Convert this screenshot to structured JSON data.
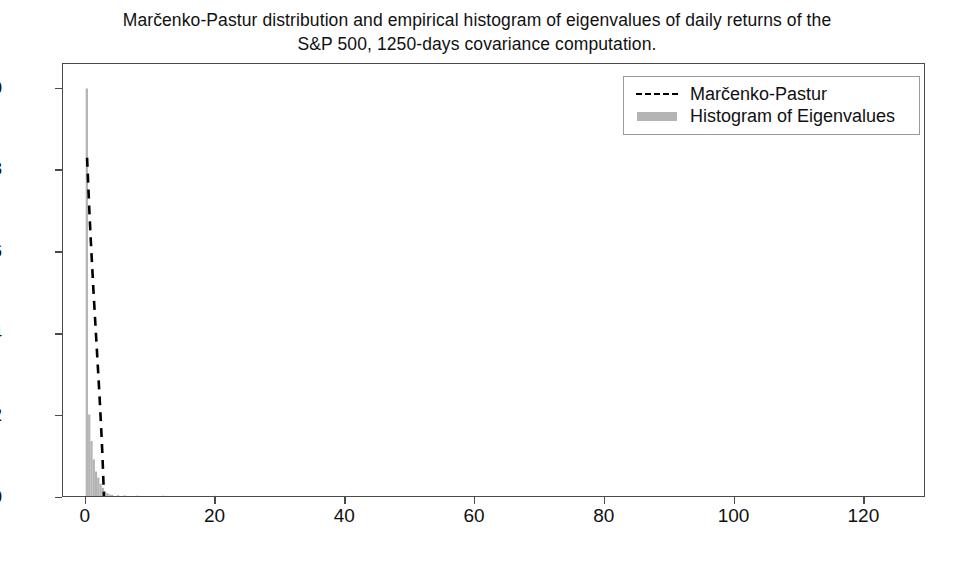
{
  "chart_data": {
    "type": "bar",
    "title": "Marčenko-Pastur distribution and empirical histogram of eigenvalues of daily returns of the\nS&P 500, 1250-days covariance computation.",
    "xlabel": "",
    "ylabel": "",
    "xlim": [
      -3.5,
      129.5
    ],
    "ylim": [
      0.0,
      1.06
    ],
    "grid": false,
    "legend_position": "upper right",
    "xticks": [
      0,
      20,
      40,
      60,
      80,
      100,
      120
    ],
    "xtick_labels": [
      "0",
      "20",
      "40",
      "60",
      "80",
      "100",
      "120"
    ],
    "yticks": [
      0.0,
      0.2,
      0.4,
      0.6,
      0.8,
      1.0
    ],
    "ytick_labels": [
      "0.0",
      "0.2",
      "0.4",
      "0.6",
      "0.8",
      "1.0"
    ],
    "series": [
      {
        "name": "Histogram of Eigenvalues",
        "type": "bar",
        "color": "#b4b4b4",
        "bar_width": 0.35,
        "x": [
          0.18,
          0.55,
          0.9,
          1.25,
          1.6,
          1.95,
          2.3,
          2.65,
          3.0,
          3.35,
          3.7,
          4.1,
          5.0,
          6.0,
          8.0,
          12.0,
          20.0,
          40.0,
          80.0,
          120.0
        ],
        "values": [
          1.0,
          0.2,
          0.135,
          0.09,
          0.06,
          0.045,
          0.03,
          0.02,
          0.012,
          0.007,
          0.004,
          0.003,
          0.002,
          0.0015,
          0.001,
          0.0008,
          0.0005,
          0.0003,
          0.0002,
          0.0001
        ]
      },
      {
        "name": "Marčenko-Pastur",
        "type": "line",
        "color": "#000000",
        "linestyle": "dashed",
        "x": [
          0.22,
          0.3,
          0.45,
          0.6,
          0.8,
          1.0,
          1.2,
          1.4,
          1.6,
          1.8,
          2.0,
          2.2,
          2.4,
          2.55,
          2.65,
          2.72,
          2.78,
          2.82
        ],
        "values": [
          0.83,
          0.8,
          0.745,
          0.69,
          0.625,
          0.565,
          0.505,
          0.45,
          0.395,
          0.34,
          0.285,
          0.228,
          0.165,
          0.115,
          0.075,
          0.045,
          0.018,
          0.0
        ]
      }
    ]
  },
  "legend": {
    "items": [
      {
        "label": "Marčenko-Pastur",
        "key": "dashed-line",
        "color": "#000000"
      },
      {
        "label": "Histogram of Eigenvalues",
        "key": "filled-patch",
        "color": "#b4b4b4"
      }
    ]
  },
  "axis_colors": {
    "frame": "#4a4a4a",
    "text": "#111111"
  }
}
